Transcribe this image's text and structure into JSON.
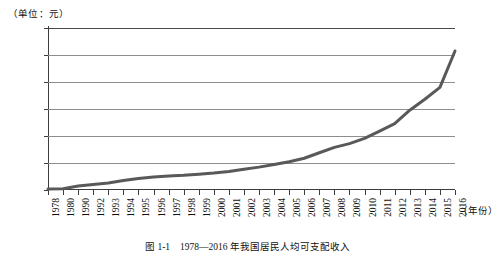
{
  "figure": {
    "unit_label": "（单位：元）",
    "x_axis_name": "（年份）",
    "caption": "图 1-1　1978—2016 年我国居民人均可支配收入"
  },
  "chart_data": {
    "type": "line",
    "title": "",
    "subtitle": "",
    "xlabel": "（年份）",
    "ylabel": "（单位：元）",
    "ylim": [
      0,
      60000
    ],
    "ytick_values": [
      0,
      10000,
      20000,
      30000,
      40000,
      50000,
      60000
    ],
    "ytick_labels": [
      "0",
      "10000",
      "20000",
      "30000",
      "40000",
      "50000",
      "60000"
    ],
    "grid": true,
    "legend": "none",
    "line_color": "#595959",
    "line_width_px": 3,
    "categories": [
      "1978",
      "1980",
      "1990",
      "1992",
      "1993",
      "1994",
      "1995",
      "1996",
      "1997",
      "1998",
      "1999",
      "2000",
      "2001",
      "2002",
      "2003",
      "2004",
      "2005",
      "2006",
      "2007",
      "2008",
      "2009",
      "2010",
      "2011",
      "2012",
      "2013",
      "2014",
      "2015",
      "2016"
    ],
    "values": [
      343,
      478,
      1510,
      2027,
      2577,
      3496,
      4283,
      4839,
      5160,
      5425,
      5854,
      6280,
      6860,
      7703,
      8472,
      9422,
      10493,
      11760,
      13786,
      15781,
      17175,
      19109,
      21810,
      24565,
      29547,
      33600,
      38000,
      51500
    ],
    "series": [
      {
        "name": "居民人均可支配收入",
        "values": [
          343,
          478,
          1510,
          2027,
          2577,
          3496,
          4283,
          4839,
          5160,
          5425,
          5854,
          6280,
          6860,
          7703,
          8472,
          9422,
          10493,
          11760,
          13786,
          15781,
          17175,
          19109,
          21810,
          24565,
          29547,
          33600,
          38000,
          51500
        ]
      }
    ],
    "annotations": []
  }
}
